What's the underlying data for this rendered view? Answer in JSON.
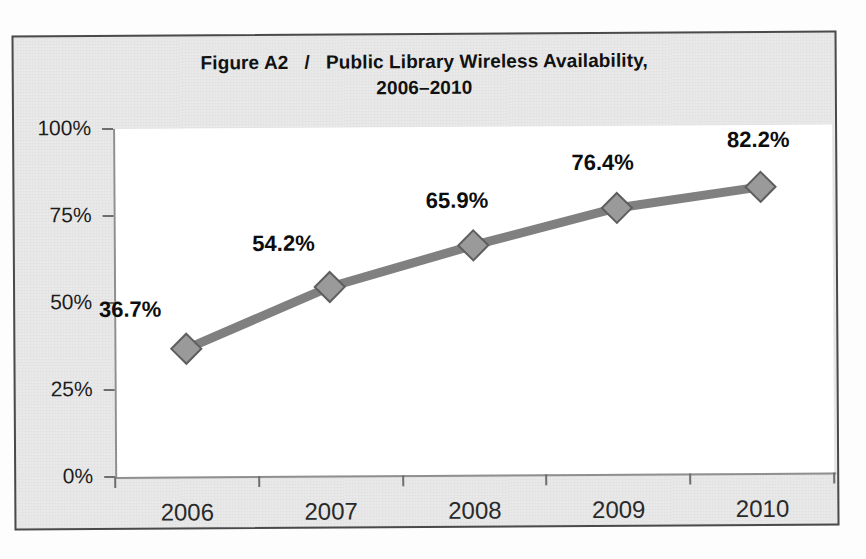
{
  "figure": {
    "title_line1": "Figure A2   /   Public Library Wireless Availability,",
    "title_line2": "2006–2010",
    "frame_color": "#4a4a4a",
    "background_color": "#e9e9e9",
    "plot_background_color": "#ffffff"
  },
  "chart_data": {
    "type": "line",
    "title": "Figure A2 / Public Library Wireless Availability, 2006–2010",
    "xlabel": "",
    "ylabel": "",
    "categories": [
      "2006",
      "2007",
      "2008",
      "2009",
      "2010"
    ],
    "values": [
      36.7,
      54.2,
      65.9,
      76.4,
      82.2
    ],
    "data_labels": [
      "36.7%",
      "54.2%",
      "65.9%",
      "76.4%",
      "82.2%"
    ],
    "ylim": [
      0,
      100
    ],
    "ytick_values": [
      0,
      25,
      50,
      75,
      100
    ],
    "ytick_labels": [
      "0%",
      "25%",
      "50%",
      "75%",
      "100%"
    ],
    "grid": false,
    "legend": false,
    "marker": "diamond",
    "series_color": "#808080",
    "marker_color": "#9a9a9a",
    "marker_edge_color": "#5e5e5e",
    "label_color": "#0d0d0d"
  }
}
